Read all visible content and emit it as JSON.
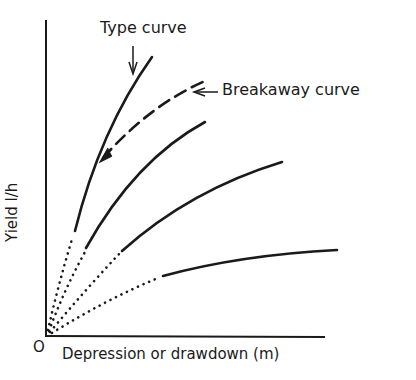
{
  "diagram": {
    "annotations": {
      "type_curve": "Type curve",
      "breakaway_curve": "Breakaway curve"
    },
    "axes": {
      "origin_label": "O",
      "x_label": "Depression or drawdown (m)",
      "y_label": "Yield  l/h"
    },
    "curves": [
      {
        "name": "type-curve",
        "style": "solid with dotted start"
      },
      {
        "name": "breakaway-curve",
        "style": "dashed"
      },
      {
        "name": "curve-2",
        "style": "solid with dotted start"
      },
      {
        "name": "curve-3",
        "style": "solid with dotted start"
      },
      {
        "name": "curve-4",
        "style": "solid with dotted start"
      }
    ],
    "colors": {
      "ink": "#1a1a1a",
      "background": "#ffffff"
    }
  }
}
